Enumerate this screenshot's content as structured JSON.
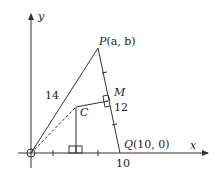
{
  "diagram": {
    "axes": {
      "x_label": "x",
      "y_label": "y"
    },
    "points": {
      "P": {
        "name": "P",
        "coords_text": "(a, b)"
      },
      "Q": {
        "name": "Q",
        "coords_text": "(10, 0)"
      },
      "M": {
        "name": "M"
      },
      "C": {
        "name": "C"
      },
      "O": {
        "name": "O"
      }
    },
    "labels": {
      "OP_length": "14",
      "PQ_length": "12",
      "x_tick_10": "10"
    },
    "segments": [
      {
        "from": "O",
        "to": "P",
        "style": "solid",
        "length_label": "14"
      },
      {
        "from": "P",
        "to": "Q",
        "style": "solid",
        "length_label": "12"
      },
      {
        "from": "O",
        "to": "C",
        "style": "dashed"
      },
      {
        "from": "C",
        "to": "M",
        "style": "solid",
        "note": "perpendicular to PQ"
      },
      {
        "from": "C",
        "to": "x-axis",
        "style": "solid",
        "note": "perpendicular to x-axis"
      }
    ],
    "colors": {
      "stroke": "#333333",
      "text": "#222222"
    }
  }
}
